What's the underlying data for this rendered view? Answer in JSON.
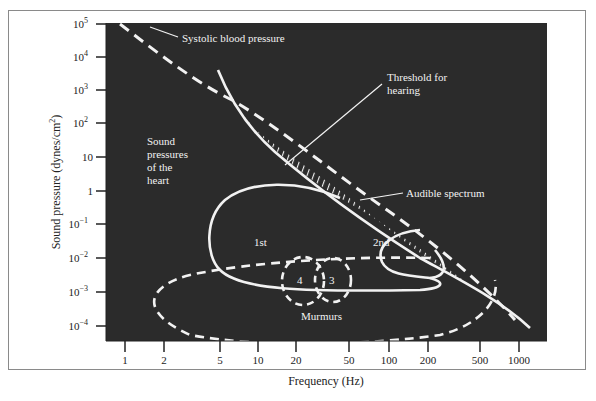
{
  "chart_data": {
    "type": "line",
    "title": "",
    "xlabel": "Frequency (Hz)",
    "ylabel": "Sound pressure (dynes/cm2)",
    "x_scale": "log",
    "y_scale": "log",
    "xlim": [
      0.8,
      1400
    ],
    "ylim": [
      0.0001,
      100000
    ],
    "x_ticks": [
      "1",
      "2",
      "5",
      "10",
      "20",
      "50",
      "100",
      "200",
      "500",
      "1000"
    ],
    "y_ticks": [
      "10^5",
      "10^4",
      "10^3",
      "10^2",
      "10",
      "1",
      "10^-1",
      "10^-2",
      "10^-3",
      "10^-4"
    ],
    "grid": false,
    "background": "#2b2b2b",
    "series": [
      {
        "name": "Systolic blood pressure",
        "style": "dashed",
        "x": [
          1,
          5,
          20,
          100,
          1000,
          1300
        ],
        "y": [
          100000,
          150,
          3,
          0.05,
          0.0003,
          0.0001
        ]
      },
      {
        "name": "Threshold for hearing",
        "style": "solid",
        "x": [
          5,
          10,
          20,
          50,
          100,
          200,
          500,
          1000
        ],
        "y": [
          300,
          10,
          1,
          0.1,
          0.03,
          0.005,
          0.0005,
          0.0002
        ]
      },
      {
        "name": "1st",
        "style": "solid-closed",
        "region": "heart sound 1",
        "x_range": [
          5,
          200
        ],
        "y_range": [
          0.002,
          1
        ]
      },
      {
        "name": "2nd",
        "style": "solid-closed",
        "region": "heart sound 2",
        "x_range": [
          60,
          200
        ],
        "y_range": [
          0.005,
          0.1
        ]
      },
      {
        "name": "3",
        "style": "dashed-closed",
        "region": "heart sound 3",
        "x_range": [
          30,
          50
        ],
        "y_range": [
          0.0005,
          0.01
        ]
      },
      {
        "name": "4",
        "style": "dashed-closed",
        "region": "heart sound 4",
        "x_range": [
          17,
          35
        ],
        "y_range": [
          0.0005,
          0.01
        ]
      },
      {
        "name": "Murmurs",
        "style": "dashed-closed",
        "x_range": [
          3,
          600
        ],
        "y_range": [
          0.0001,
          0.01
        ]
      }
    ],
    "annotations": [
      "Systolic blood pressure",
      "Threshold for hearing",
      "Sound pressures of the heart",
      "Audible spectrum",
      "1st",
      "2nd",
      "3",
      "4",
      "Murmurs"
    ],
    "legend": "none (inline annotations)"
  },
  "labels": {
    "xlabel": "Frequency (Hz)",
    "ylabel": "Sound pressure (dynes/cm",
    "ylabel_sup": "2",
    "ylabel_end": ")",
    "systolic": "Systolic blood pressure",
    "threshold_line1": "Threshold for",
    "threshold_line2": "hearing",
    "heart_line1": "Sound",
    "heart_line2": "pressures",
    "heart_line3": "of the",
    "heart_line4": "heart",
    "audible": "Audible spectrum",
    "first": "1st",
    "second": "2nd",
    "third": "3",
    "fourth": "4",
    "murmurs": "Murmurs"
  },
  "xticks": [
    {
      "label": "1",
      "x": 125
    },
    {
      "label": "2",
      "x": 164
    },
    {
      "label": "5",
      "x": 220
    },
    {
      "label": "10",
      "x": 258
    },
    {
      "label": "20",
      "x": 296
    },
    {
      "label": "50",
      "x": 349
    },
    {
      "label": "100",
      "x": 389
    },
    {
      "label": "200",
      "x": 428
    },
    {
      "label": "500",
      "x": 480
    },
    {
      "label": "1000",
      "x": 519
    }
  ],
  "yticks": [
    {
      "base": "10",
      "exp": "5",
      "y": 24
    },
    {
      "base": "10",
      "exp": "4",
      "y": 57
    },
    {
      "base": "10",
      "exp": "3",
      "y": 90
    },
    {
      "base": "10",
      "exp": "2",
      "y": 123
    },
    {
      "base": "10",
      "exp": "",
      "y": 157
    },
    {
      "base": "1",
      "exp": "",
      "y": 191
    },
    {
      "base": "10",
      "exp": "−1",
      "y": 224
    },
    {
      "base": "10",
      "exp": "−2",
      "y": 258
    },
    {
      "base": "10",
      "exp": "−3",
      "y": 292
    },
    {
      "base": "10",
      "exp": "−4",
      "y": 326
    }
  ]
}
